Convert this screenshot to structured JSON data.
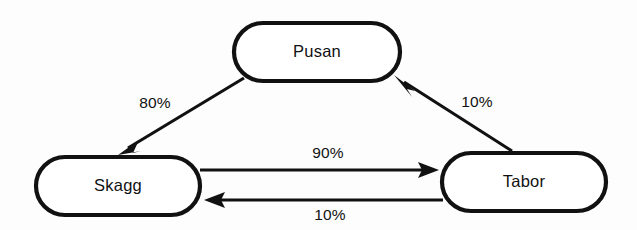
{
  "diagram": {
    "type": "state-transition-diagram",
    "background_color": "#fdfdfd",
    "stroke_color": "#111111",
    "node_fill_color": "#ffffff",
    "nodes": [
      {
        "id": "pusan",
        "label": "Pusan"
      },
      {
        "id": "skagg",
        "label": "Skagg"
      },
      {
        "id": "tabor",
        "label": "Tabor"
      }
    ],
    "edges": [
      {
        "id": "pusan-to-skagg",
        "from": "Pusan",
        "to": "Skagg",
        "label": "80%"
      },
      {
        "id": "tabor-to-pusan",
        "from": "Tabor",
        "to": "Pusan",
        "label": "10%"
      },
      {
        "id": "skagg-to-tabor",
        "from": "Skagg",
        "to": "Tabor",
        "label": "90%"
      },
      {
        "id": "tabor-to-skagg",
        "from": "Tabor",
        "to": "Skagg",
        "label": "10%"
      }
    ]
  }
}
